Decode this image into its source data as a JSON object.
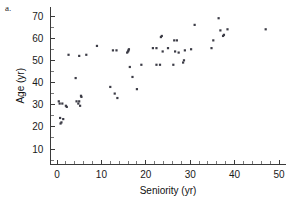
{
  "figure": {
    "panel_label": "a.",
    "background_color": "#ffffff",
    "point_color": "#3c3c46",
    "axis_color": "#3a3a3a"
  },
  "chart_data": {
    "type": "scatter",
    "title": "",
    "xlabel": "Seniority (yr)",
    "ylabel": "Age (yr)",
    "xlim": [
      -1.5,
      51.5
    ],
    "ylim": [
      3,
      74
    ],
    "grid": false,
    "legend": null,
    "x_ticks": [
      0,
      10,
      20,
      30,
      40,
      50
    ],
    "x_tick_labels": [
      "0",
      "10",
      "20",
      "30",
      "40",
      "50"
    ],
    "x_minor_tick_step": 2,
    "y_ticks": [
      10,
      20,
      30,
      40,
      50,
      60,
      70
    ],
    "y_tick_labels": [
      "10",
      "20",
      "30",
      "40",
      "50",
      "60",
      "70"
    ],
    "y_minor_tick_step": 5,
    "marker": "square",
    "marker_size": 2.2,
    "n_points": 62,
    "points": [
      {
        "x": 0.4,
        "y": 31.5
      },
      {
        "x": 0.6,
        "y": 30.5
      },
      {
        "x": 0.7,
        "y": 24.0
      },
      {
        "x": 0.8,
        "y": 21.5
      },
      {
        "x": 1.0,
        "y": 22.0
      },
      {
        "x": 1.2,
        "y": 30.5
      },
      {
        "x": 1.4,
        "y": 23.5
      },
      {
        "x": 2.0,
        "y": 29.5
      },
      {
        "x": 2.2,
        "y": 29.0
      },
      {
        "x": 2.6,
        "y": 52.5
      },
      {
        "x": 4.2,
        "y": 42.0
      },
      {
        "x": 4.4,
        "y": 31.5
      },
      {
        "x": 4.8,
        "y": 30.5
      },
      {
        "x": 5.0,
        "y": 31.5
      },
      {
        "x": 5.0,
        "y": 52.0
      },
      {
        "x": 5.2,
        "y": 29.5
      },
      {
        "x": 5.4,
        "y": 34.0
      },
      {
        "x": 5.5,
        "y": 33.5
      },
      {
        "x": 6.6,
        "y": 52.5
      },
      {
        "x": 9.0,
        "y": 56.5
      },
      {
        "x": 12.0,
        "y": 38.0
      },
      {
        "x": 12.6,
        "y": 54.5
      },
      {
        "x": 13.0,
        "y": 35.0
      },
      {
        "x": 13.4,
        "y": 54.5
      },
      {
        "x": 13.6,
        "y": 33.0
      },
      {
        "x": 15.8,
        "y": 53.5
      },
      {
        "x": 16.0,
        "y": 54.0
      },
      {
        "x": 16.1,
        "y": 54.5
      },
      {
        "x": 16.2,
        "y": 55.0
      },
      {
        "x": 16.4,
        "y": 47.0
      },
      {
        "x": 17.0,
        "y": 42.5
      },
      {
        "x": 18.0,
        "y": 37.0
      },
      {
        "x": 19.0,
        "y": 48.0
      },
      {
        "x": 21.6,
        "y": 55.5
      },
      {
        "x": 22.4,
        "y": 55.5
      },
      {
        "x": 22.4,
        "y": 48.0
      },
      {
        "x": 23.2,
        "y": 48.0
      },
      {
        "x": 23.4,
        "y": 60.5
      },
      {
        "x": 23.6,
        "y": 61.0
      },
      {
        "x": 23.8,
        "y": 54.0
      },
      {
        "x": 25.0,
        "y": 55.5
      },
      {
        "x": 26.2,
        "y": 48.0
      },
      {
        "x": 26.4,
        "y": 59.0
      },
      {
        "x": 26.6,
        "y": 54.0
      },
      {
        "x": 27.0,
        "y": 59.0
      },
      {
        "x": 27.4,
        "y": 53.5
      },
      {
        "x": 28.4,
        "y": 49.0
      },
      {
        "x": 28.6,
        "y": 50.0
      },
      {
        "x": 28.8,
        "y": 54.5
      },
      {
        "x": 30.2,
        "y": 55.0
      },
      {
        "x": 31.0,
        "y": 66.0
      },
      {
        "x": 34.8,
        "y": 55.5
      },
      {
        "x": 35.2,
        "y": 59.0
      },
      {
        "x": 36.4,
        "y": 69.0
      },
      {
        "x": 36.8,
        "y": 63.5
      },
      {
        "x": 37.4,
        "y": 61.0
      },
      {
        "x": 37.6,
        "y": 61.5
      },
      {
        "x": 38.4,
        "y": 64.0
      },
      {
        "x": 47.0,
        "y": 64.0
      }
    ]
  }
}
